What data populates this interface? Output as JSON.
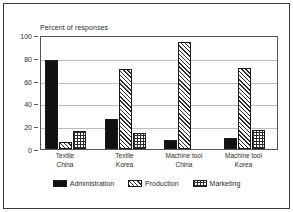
{
  "chart_data": {
    "type": "bar",
    "title": "Percent of responses",
    "xlabel": "",
    "ylabel": "",
    "ylim": [
      0,
      100
    ],
    "yticks": [
      0,
      20,
      40,
      60,
      80,
      100
    ],
    "ytick_labels": [
      "0",
      "20",
      "40",
      "60",
      "80",
      "100"
    ],
    "grid": true,
    "legend_position": "bottom",
    "categories": [
      "Textile China",
      "Textile Korea",
      "Machine tool China",
      "Machine tool Korea"
    ],
    "category_lines": [
      {
        "line1": "Textile",
        "line2": "China"
      },
      {
        "line1": "Textile",
        "line2": "Korea"
      },
      {
        "line1": "Machine tool",
        "line2": "China"
      },
      {
        "line1": "Machine tool",
        "line2": "Korea"
      }
    ],
    "series": [
      {
        "name": "Administration",
        "pattern": "solid-black",
        "color": "#111111",
        "values": [
          78,
          26,
          8,
          10
        ]
      },
      {
        "name": "Production",
        "pattern": "diagonal-hatch",
        "color": "#2b2b2b",
        "values": [
          6,
          70,
          94,
          71
        ]
      },
      {
        "name": "Marketing",
        "pattern": "crosshatch-grid",
        "color": "#2b2b2b",
        "values": [
          16,
          14,
          0,
          17
        ]
      }
    ]
  },
  "figure": {
    "frame_color": "#3a3a3a",
    "background": "#ffffff",
    "axis_color": "#555555",
    "gridline_color": "#bdbdbd"
  }
}
